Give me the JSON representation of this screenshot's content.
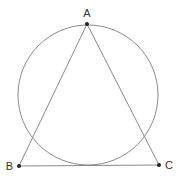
{
  "diagram": {
    "type": "geometry",
    "stroke_color": "#8a8a8a",
    "point_color": "#222222",
    "points": [
      {
        "id": "A",
        "label": "A",
        "x": 87,
        "y": 24
      },
      {
        "id": "B",
        "label": "B",
        "x": 19,
        "y": 166
      },
      {
        "id": "C",
        "label": "C",
        "x": 159,
        "y": 165
      }
    ],
    "segments": [
      {
        "from": "A",
        "to": "B"
      },
      {
        "from": "A",
        "to": "C"
      },
      {
        "from": "B",
        "to": "C"
      }
    ],
    "circle": {
      "cx": 88,
      "cy": 95,
      "r": 70
    }
  }
}
